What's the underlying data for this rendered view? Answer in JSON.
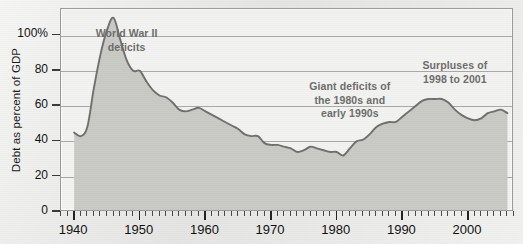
{
  "chart_data": {
    "type": "area",
    "title": "",
    "xlabel": "",
    "ylabel": "Debt as percent of GDP",
    "xlim": [
      1938,
      2007
    ],
    "ylim": [
      0,
      115
    ],
    "grid": true,
    "legend": "none",
    "y_ticks": [
      0,
      20,
      40,
      60,
      80,
      100
    ],
    "y_tick_labels": [
      "0",
      "20",
      "40",
      "60",
      "80",
      "100%"
    ],
    "x_ticks": [
      1940,
      1950,
      1960,
      1970,
      1980,
      1990,
      2000
    ],
    "x_tick_labels": [
      "1940",
      "1950",
      "1960",
      "1970",
      "1980",
      "1990",
      "2000"
    ],
    "x_minor_tick_step": 1,
    "series": [
      {
        "name": "Debt as percent of GDP",
        "line_color": "#6f6f6d",
        "fill_color": "#c9c9c6",
        "x": [
          1940,
          1941,
          1942,
          1943,
          1944,
          1945,
          1946,
          1947,
          1948,
          1949,
          1950,
          1951,
          1952,
          1953,
          1954,
          1955,
          1956,
          1957,
          1958,
          1959,
          1960,
          1961,
          1962,
          1963,
          1964,
          1965,
          1966,
          1967,
          1968,
          1969,
          1970,
          1971,
          1972,
          1973,
          1974,
          1975,
          1976,
          1977,
          1978,
          1979,
          1980,
          1981,
          1982,
          1983,
          1984,
          1985,
          1986,
          1987,
          1988,
          1989,
          1990,
          1991,
          1992,
          1993,
          1994,
          1995,
          1996,
          1997,
          1998,
          1999,
          2000,
          2001,
          2002,
          2003,
          2004,
          2005,
          2006
        ],
        "values": [
          45,
          43,
          48,
          70,
          89,
          103,
          110,
          98,
          86,
          80,
          80,
          74,
          69,
          66,
          65,
          62,
          58,
          57,
          58,
          59,
          57,
          55,
          53,
          51,
          49,
          47,
          44,
          43,
          43,
          39,
          38,
          38,
          37,
          36,
          34,
          35,
          37,
          36,
          35,
          34,
          34,
          32,
          36,
          40,
          41,
          44,
          48,
          50,
          51,
          51,
          54,
          57,
          60,
          63,
          64,
          64,
          64,
          62,
          58,
          55,
          53,
          52,
          53,
          56,
          57,
          58,
          56
        ],
        "annotations": [
          {
            "text": "World War II\ndeficits",
            "at_year": 1948,
            "at_value": 100
          },
          {
            "text": "Giant deficits of\nthe 1980s and\nearly 1990s",
            "at_year": 1982,
            "at_value": 70
          },
          {
            "text": "Surpluses of\n1998 to 2001",
            "at_year": 1998,
            "at_value": 82
          }
        ]
      }
    ]
  },
  "annotations": {
    "wwii": "World War II\ndeficits",
    "giant_deficits": "Giant deficits of\nthe 1980s and\nearly 1990s",
    "surpluses": "Surpluses of\n1998 to 2001"
  },
  "axes": {
    "y_title": "Debt as percent of GDP"
  }
}
